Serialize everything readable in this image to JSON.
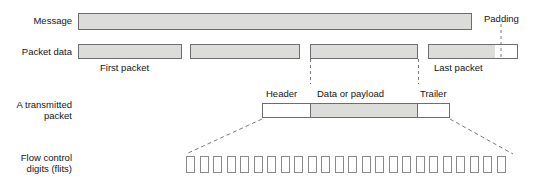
{
  "diagram": {
    "colors": {
      "fill_gray": "#dcdcda",
      "fill_white": "#ffffff",
      "stroke": "#6d6d6d",
      "flit_stroke": "#8a8a8a",
      "dash": "#7a7a7a",
      "text": "#141414"
    },
    "rows": [
      {
        "id": "message",
        "label": "Message",
        "bars": [
          {
            "name": "message-bar",
            "fill": "gray",
            "x": 78,
            "y": 13,
            "w": 394,
            "h": 17
          }
        ]
      },
      {
        "id": "packet-data",
        "label": "Packet data",
        "bars": [
          {
            "name": "packet-1",
            "fill": "gray",
            "x": 78,
            "y": 44,
            "w": 104,
            "h": 15
          },
          {
            "name": "packet-2",
            "fill": "gray",
            "x": 190,
            "y": 44,
            "w": 110,
            "h": 15
          },
          {
            "name": "packet-3",
            "fill": "gray",
            "x": 310,
            "y": 44,
            "w": 108,
            "h": 15
          },
          {
            "name": "packet-4-data",
            "fill": "gray",
            "x": 428,
            "y": 44,
            "w": 67,
            "h": 15
          },
          {
            "name": "packet-4-padding",
            "fill": "white",
            "x": 495,
            "y": 44,
            "w": 23,
            "h": 15
          }
        ],
        "captions": [
          {
            "name": "first-packet-caption",
            "text": "First packet",
            "x": 100,
            "y": 62
          },
          {
            "name": "last-packet-caption",
            "text": "Last packet",
            "x": 434,
            "y": 62
          },
          {
            "name": "padding-caption",
            "text": "Padding",
            "x": 484,
            "y": 14
          }
        ]
      },
      {
        "id": "transmitted-packet",
        "label": "A transmitted\npacket",
        "bars": [
          {
            "name": "header-segment",
            "fill": "white",
            "x": 262,
            "y": 103,
            "w": 48,
            "h": 15
          },
          {
            "name": "payload-segment",
            "fill": "gray",
            "x": 310,
            "y": 103,
            "w": 108,
            "h": 15
          },
          {
            "name": "trailer-segment",
            "fill": "white",
            "x": 418,
            "y": 103,
            "w": 32,
            "h": 15
          }
        ],
        "captions": [
          {
            "name": "header-caption",
            "text": "Header",
            "x": 266,
            "y": 89
          },
          {
            "name": "payload-caption",
            "text": "Data or payload",
            "x": 318,
            "y": 89
          },
          {
            "name": "trailer-caption",
            "text": "Trailer",
            "x": 420,
            "y": 89
          }
        ]
      },
      {
        "id": "flow-control-digits",
        "label": "Flow control\ndigits (flits)",
        "flits": {
          "count": 24,
          "x_start": 186,
          "y": 156,
          "pitch": 13.5,
          "w": 9,
          "h": 17
        }
      }
    ],
    "row_labels": [
      {
        "name": "row-label-message",
        "text": "Message",
        "x": 4,
        "y": 15,
        "w": 68
      },
      {
        "name": "row-label-packet-data",
        "text": "Packet data",
        "x": 4,
        "y": 46,
        "w": 68
      },
      {
        "name": "row-label-transmitted-packet",
        "line1": "A transmitted",
        "line2": "packet",
        "x": 4,
        "y": 99,
        "w": 68
      },
      {
        "name": "row-label-flow-control",
        "line1": "Flow control",
        "line2": "digits (flits)",
        "x": 4,
        "y": 152,
        "w": 68
      }
    ],
    "connectors": {
      "padding_pointer": {
        "x": 501,
        "y1": 24,
        "y2": 59
      },
      "packet3_left_guide": {
        "x": 310,
        "y1": 59,
        "y2": 83
      },
      "packet3_right_guide": {
        "x": 418,
        "y1": 59,
        "y2": 83
      },
      "expand_left": {
        "x1": 262,
        "y1": 119,
        "x2": 186,
        "y2": 154
      },
      "expand_right": {
        "x1": 450,
        "y1": 119,
        "x2": 512,
        "y2": 154
      }
    }
  }
}
